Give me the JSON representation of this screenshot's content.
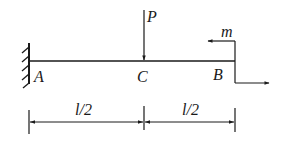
{
  "diagram": {
    "type": "cantilever-beam",
    "colors": {
      "stroke": "#1a1a1a",
      "background": "#ffffff"
    },
    "points": [
      {
        "id": "A",
        "label": "A"
      },
      {
        "id": "C",
        "label": "C"
      },
      {
        "id": "B",
        "label": "B"
      }
    ],
    "loads": {
      "force": {
        "label": "P",
        "at": "C",
        "direction": "down"
      },
      "moment": {
        "label": "m",
        "at": "B"
      }
    },
    "dimensions": [
      {
        "label": "l/2",
        "from": "A",
        "to": "C"
      },
      {
        "label": "l/2",
        "from": "C",
        "to": "B"
      }
    ]
  }
}
